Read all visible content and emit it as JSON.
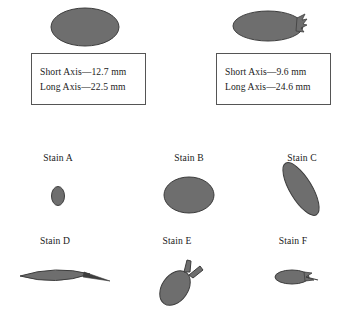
{
  "figure": {
    "background_color": "#ffffff",
    "stain_fill_color": "#6e6e6e",
    "stain_outline_color": "#3d3d3d",
    "box_border_color": "#555555",
    "text_color": "#1a1a1a"
  },
  "reference_stains": [
    {
      "id": "left",
      "shape": "ellipse",
      "short_axis_label": "Short Axis—12.7 mm",
      "long_axis_label": "Long Axis—22.5 mm",
      "short_axis_mm": 12.7,
      "long_axis_mm": 22.5
    },
    {
      "id": "right",
      "shape": "ellipse-with-spines",
      "short_axis_label": "Short Axis—9.6 mm",
      "long_axis_label": "Long Axis—24.6 mm",
      "short_axis_mm": 9.6,
      "long_axis_mm": 24.6
    }
  ],
  "stains": [
    {
      "label": "Stain A",
      "shape": "small-vertical-ellipse"
    },
    {
      "label": "Stain B",
      "shape": "large-horizontal-ellipse"
    },
    {
      "label": "Stain C",
      "shape": "tilted-elongated-ellipse"
    },
    {
      "label": "Stain D",
      "shape": "lens-with-tail"
    },
    {
      "label": "Stain E",
      "shape": "ellipse-with-two-spines"
    },
    {
      "label": "Stain F",
      "shape": "small-ellipse-with-spines"
    }
  ]
}
